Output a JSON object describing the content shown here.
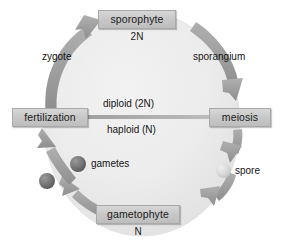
{
  "diagram": {
    "type": "cycle-diagram",
    "background_color": "#ffffff",
    "disc_color": "#ececec",
    "arrow_color": "#9a9a9a",
    "box_color": "#c9c9c9"
  },
  "stages": [
    {
      "id": "sporophyte",
      "label": "sporophyte",
      "ploidy": "2N"
    },
    {
      "id": "meiosis",
      "label": "meiosis",
      "ploidy": ""
    },
    {
      "id": "gametophyte",
      "label": "gametophyte",
      "ploidy": "N"
    },
    {
      "id": "fertilization",
      "label": "fertilization",
      "ploidy": ""
    }
  ],
  "arrows": [
    {
      "id": "zygote",
      "label": "zygote",
      "from": "fertilization",
      "to": "sporophyte"
    },
    {
      "id": "sporangium",
      "label": "sporangium",
      "from": "sporophyte",
      "to": "meiosis"
    },
    {
      "id": "spore-path",
      "label": "",
      "from": "meiosis",
      "to": "gametophyte"
    },
    {
      "id": "gamete-path",
      "label": "",
      "from": "gametophyte",
      "to": "fertilization"
    }
  ],
  "divider": {
    "upper_label": "diploid (2N)",
    "lower_label": "haploid (N)"
  },
  "cells": [
    {
      "id": "gametes",
      "label": "gametes",
      "tone": "dark"
    },
    {
      "id": "spore",
      "label": "spore",
      "tone": "light"
    }
  ]
}
